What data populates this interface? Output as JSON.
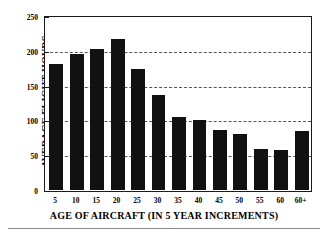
{
  "chart_data": {
    "type": "bar",
    "title": "",
    "xlabel": "AGE OF AIRCRAFT (IN 5 YEAR INCREMENTS)",
    "ylabel": "AVERAGE FLIGHT HOURS",
    "categories": [
      "5",
      "10",
      "15",
      "20",
      "25",
      "30",
      "35",
      "40",
      "45",
      "50",
      "55",
      "60",
      "60+"
    ],
    "values": [
      181,
      195,
      202,
      217,
      174,
      137,
      105,
      100,
      86,
      81,
      59,
      58,
      85
    ],
    "ylim": [
      0,
      250
    ],
    "yticks": [
      0,
      50,
      100,
      150,
      200,
      250
    ],
    "ytick_labels": [
      "0",
      "50",
      "100",
      "150",
      "200",
      "250"
    ],
    "grid": "horizontal-dashed",
    "legend": "none",
    "bar_color": "#111111",
    "axis_color": "#1a1a1a",
    "grid_color": "#555555"
  }
}
